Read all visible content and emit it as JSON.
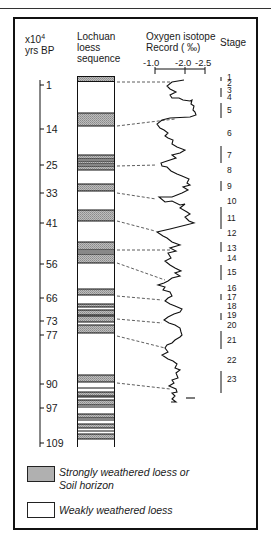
{
  "header": {
    "age_label_line1": "x10",
    "age_label_sup": "4",
    "age_label_line2": "yrs BP",
    "loess_label_line1": "Lochuan",
    "loess_label_line2": "loess",
    "loess_label_line3": "sequence",
    "isotope_label_line1": "Oxygen isotope",
    "isotope_label_line2": "Record (  ‰)",
    "stage_label": "Stage"
  },
  "isotope_axis": {
    "ticks": [
      "-1.0",
      "-2.0",
      "-2.5"
    ]
  },
  "age_ticks": [
    {
      "label": "1",
      "y": 85
    },
    {
      "label": "14",
      "y": 129
    },
    {
      "label": "25",
      "y": 165
    },
    {
      "label": "33",
      "y": 193
    },
    {
      "label": "41",
      "y": 223
    },
    {
      "label": "56",
      "y": 264
    },
    {
      "label": "66",
      "y": 298
    },
    {
      "label": "73",
      "y": 321
    },
    {
      "label": "77",
      "y": 335
    },
    {
      "label": "90",
      "y": 384
    },
    {
      "label": "97",
      "y": 408
    },
    {
      "label": "109",
      "y": 443
    }
  ],
  "stages": [
    {
      "label": "1",
      "y": 77
    },
    {
      "label": "2",
      "y": 83
    },
    {
      "label": "3",
      "y": 90
    },
    {
      "label": "4",
      "y": 97
    },
    {
      "label": "5",
      "y": 110
    },
    {
      "label": "6",
      "y": 133
    },
    {
      "label": "7",
      "y": 155
    },
    {
      "label": "8",
      "y": 170
    },
    {
      "label": "9",
      "y": 186
    },
    {
      "label": "10",
      "y": 201
    },
    {
      "label": "11",
      "y": 218
    },
    {
      "label": "12",
      "y": 233
    },
    {
      "label": "13",
      "y": 248
    },
    {
      "label": "14",
      "y": 258
    },
    {
      "label": "15",
      "y": 272
    },
    {
      "label": "16",
      "y": 288
    },
    {
      "label": "17",
      "y": 297
    },
    {
      "label": "18",
      "y": 306
    },
    {
      "label": "19",
      "y": 315
    },
    {
      "label": "20",
      "y": 325
    },
    {
      "label": "21",
      "y": 340
    },
    {
      "label": "22",
      "y": 360
    },
    {
      "label": "23",
      "y": 379
    }
  ],
  "legend": {
    "strong_line1": "Strongly weathered loess or",
    "strong_line2": "Soil horizon",
    "weak": "Weakly weathered loess"
  },
  "colors": {
    "soil_fill": "#a8a8a8",
    "loess_fill": "#ffffff",
    "line": "#111111"
  }
}
